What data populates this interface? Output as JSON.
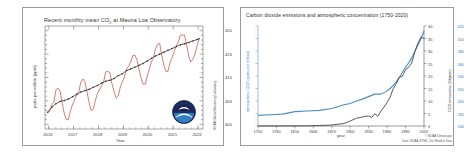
{
  "page": {
    "background": "#fdfdfd",
    "panel_count": 2
  },
  "left_panel": {
    "name": "mauna-loa-co2-panel",
    "title_prefix": "Recent monthly mean CO",
    "title_sub": "2",
    "title_suffix": " at Mauna Loa Observatory",
    "annotation_line1": "January 2022: 418.19 ppm",
    "annotation_line2": "January 2021: 415.52 ppm",
    "credit": "NOAA Global Monitoring Laboratory",
    "logo_name": "noaa-logo"
  },
  "right_panel": {
    "name": "co2-emissions-concentration-panel",
    "title": "Carbon dioxide emissions and atmospheric concentration (1750-2020)",
    "credit_line1": "© NOAA Climate.gov",
    "credit_line2": "Data: NOAA, ETHZ, Our World in Data"
  },
  "chart_data": [
    {
      "type": "line",
      "name": "mauna-loa-monthly-mean-co2",
      "title": "Recent monthly mean CO2 at Mauna Loa Observatory",
      "xlabel": "Year",
      "ylabel": "parts per million (ppm)",
      "xlim": [
        2015.85,
        2022.2
      ],
      "ylim": [
        399,
        421
      ],
      "xticks": [
        "2016",
        "2017",
        "2018",
        "2019",
        "2020",
        "2021",
        "2022"
      ],
      "xtick_values": [
        2016,
        2017,
        2018,
        2019,
        2020,
        2021,
        2022
      ],
      "yticks": [
        "400",
        "405",
        "410",
        "415",
        "420"
      ],
      "ytick_values": [
        400,
        405,
        410,
        415,
        420
      ],
      "grid": false,
      "legend": "none",
      "annotations": [
        "January 2022: 418.19 ppm",
        "January 2021: 415.52 ppm"
      ],
      "series": [
        {
          "name": "Monthly mean",
          "color": "#c8504a",
          "x": [
            2015.96,
            2016.04,
            2016.13,
            2016.21,
            2016.29,
            2016.38,
            2016.46,
            2016.54,
            2016.63,
            2016.71,
            2016.79,
            2016.88,
            2016.96,
            2017.04,
            2017.13,
            2017.21,
            2017.29,
            2017.38,
            2017.46,
            2017.54,
            2017.63,
            2017.71,
            2017.79,
            2017.88,
            2017.96,
            2018.04,
            2018.13,
            2018.21,
            2018.29,
            2018.38,
            2018.46,
            2018.54,
            2018.63,
            2018.71,
            2018.79,
            2018.88,
            2018.96,
            2019.04,
            2019.13,
            2019.21,
            2019.29,
            2019.38,
            2019.46,
            2019.54,
            2019.63,
            2019.71,
            2019.79,
            2019.88,
            2019.96,
            2020.04,
            2020.13,
            2020.21,
            2020.29,
            2020.38,
            2020.46,
            2020.54,
            2020.63,
            2020.71,
            2020.79,
            2020.88,
            2020.96,
            2021.04,
            2021.13,
            2021.21,
            2021.29,
            2021.38,
            2021.46,
            2021.54,
            2021.63,
            2021.71,
            2021.79,
            2021.88,
            2021.96,
            2022.04
          ],
          "y": [
            402.5,
            402.8,
            404.2,
            404.8,
            407.4,
            407.7,
            407.0,
            404.5,
            402.2,
            401.0,
            401.0,
            403.0,
            404.3,
            405.2,
            406.5,
            407.0,
            409.0,
            409.7,
            409.0,
            406.9,
            404.5,
            402.9,
            403.3,
            405.2,
            406.6,
            407.4,
            408.3,
            409.2,
            411.2,
            411.3,
            411.0,
            408.7,
            406.9,
            405.6,
            406.0,
            408.0,
            409.1,
            410.1,
            411.8,
            412.4,
            413.3,
            414.7,
            414.8,
            413.9,
            411.8,
            409.9,
            408.6,
            408.6,
            410.3,
            411.8,
            413.4,
            414.1,
            416.2,
            417.1,
            417.3,
            414.8,
            412.6,
            411.3,
            411.3,
            413.3,
            414.3,
            415.5,
            416.8,
            417.6,
            419.0,
            419.1,
            419.0,
            416.9,
            414.5,
            413.3,
            413.9,
            415.0,
            416.7,
            418.2
          ]
        },
        {
          "name": "Seasonally corrected trend",
          "color": "#2b2b2b",
          "x": [
            2015.96,
            2016.13,
            2016.29,
            2016.46,
            2016.63,
            2016.79,
            2016.96,
            2017.13,
            2017.29,
            2017.46,
            2017.63,
            2017.79,
            2017.96,
            2018.13,
            2018.29,
            2018.46,
            2018.63,
            2018.79,
            2018.96,
            2019.13,
            2019.29,
            2019.46,
            2019.63,
            2019.79,
            2019.96,
            2020.13,
            2020.29,
            2020.46,
            2020.63,
            2020.79,
            2020.96,
            2021.13,
            2021.29,
            2021.46,
            2021.63,
            2021.79,
            2021.96,
            2022.04
          ],
          "y": [
            402.6,
            403.7,
            404.4,
            404.9,
            405.1,
            405.4,
            405.9,
            406.4,
            406.9,
            407.2,
            407.5,
            407.9,
            408.3,
            408.8,
            409.2,
            409.4,
            409.8,
            410.4,
            410.8,
            411.5,
            411.8,
            412.2,
            412.6,
            413.0,
            413.5,
            414.1,
            414.6,
            415.0,
            415.4,
            415.8,
            416.2,
            416.6,
            417.0,
            417.2,
            417.5,
            417.8,
            418.1,
            418.3
          ]
        }
      ]
    },
    {
      "type": "line",
      "name": "global-co2-emissions-and-concentration",
      "title": "Carbon dioxide emissions and atmospheric concentration (1750-2020)",
      "xlabel": "year",
      "ylabel_left": "atmospheric CO2 (parts per million)",
      "ylabel_right": "CO2 emissions (Gt/year)",
      "xlim": [
        1750,
        2020
      ],
      "ylim_left": [
        260,
        420
      ],
      "ylim_right": [
        0,
        40
      ],
      "xticks": [
        "1750",
        "1780",
        "1810",
        "1840",
        "1870",
        "1900",
        "1930",
        "1960",
        "1990",
        "2020"
      ],
      "xtick_values": [
        1750,
        1780,
        1810,
        1840,
        1870,
        1900,
        1930,
        1960,
        1990,
        2020
      ],
      "yticks_left": [
        "260",
        "280",
        "300",
        "320",
        "340",
        "360",
        "380",
        "400",
        "420"
      ],
      "ytick_values_left": [
        260,
        280,
        300,
        320,
        340,
        360,
        380,
        400,
        420
      ],
      "yticks_right": [
        "0",
        "5",
        "10",
        "15",
        "20",
        "25",
        "30",
        "35",
        "40"
      ],
      "ytick_values_right": [
        0,
        5,
        10,
        15,
        20,
        25,
        30,
        35,
        40
      ],
      "grid": false,
      "legend": "none",
      "series": [
        {
          "name": "Atmospheric CO2 concentration",
          "color": "#4a8fc4",
          "axis": "left",
          "x": [
            1750,
            1770,
            1790,
            1810,
            1830,
            1850,
            1870,
            1890,
            1900,
            1910,
            1920,
            1930,
            1940,
            1950,
            1958,
            1965,
            1970,
            1975,
            1980,
            1985,
            1990,
            1995,
            2000,
            2005,
            2010,
            2015,
            2020
          ],
          "y": [
            277,
            278,
            279,
            283,
            284,
            285,
            288,
            294,
            296,
            300,
            303,
            307,
            311,
            311,
            315,
            320,
            325,
            331,
            338,
            346,
            354,
            361,
            369,
            379,
            389,
            400,
            412
          ]
        },
        {
          "name": "CO2 emissions",
          "color": "#3b3b3b",
          "axis": "right",
          "x": [
            1750,
            1800,
            1830,
            1850,
            1870,
            1880,
            1890,
            1900,
            1910,
            1920,
            1925,
            1930,
            1935,
            1940,
            1945,
            1950,
            1955,
            1960,
            1965,
            1970,
            1975,
            1980,
            1985,
            1990,
            1995,
            2000,
            2005,
            2010,
            2015,
            2020
          ],
          "y": [
            0.01,
            0.03,
            0.06,
            0.2,
            0.4,
            0.7,
            1.0,
            2.0,
            3.1,
            3.6,
            3.9,
            4.0,
            3.4,
            4.9,
            3.9,
            6.0,
            7.6,
            9.4,
            11.6,
            15.0,
            17.0,
            19.5,
            19.9,
            22.6,
            23.5,
            25.2,
            29.6,
            33.1,
            35.5,
            35.0
          ]
        }
      ]
    }
  ]
}
